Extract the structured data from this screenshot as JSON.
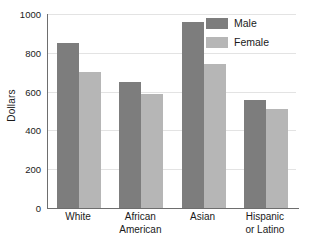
{
  "chart_data": {
    "type": "bar",
    "title": "",
    "xlabel": "",
    "ylabel": "Dollars",
    "ylim": [
      0,
      1000
    ],
    "ytick_labels": [
      "1000",
      "800",
      "600",
      "400",
      "200",
      "0"
    ],
    "ytick_values": [
      1000,
      800,
      600,
      400,
      200,
      0
    ],
    "grid": true,
    "legend_position": "top-right",
    "categories": [
      "White",
      "African American",
      "Asian",
      "Hispanic or Latino"
    ],
    "category_lines": [
      [
        "White"
      ],
      [
        "African",
        "American"
      ],
      [
        "Asian"
      ],
      [
        "Hispanic",
        "or Latino"
      ]
    ],
    "series": [
      {
        "name": "Male",
        "color": "#7d7d7d",
        "values": [
          850,
          648,
          960,
          557
        ]
      },
      {
        "name": "Female",
        "color": "#b6b6b6",
        "values": [
          700,
          588,
          740,
          508
        ]
      }
    ]
  }
}
